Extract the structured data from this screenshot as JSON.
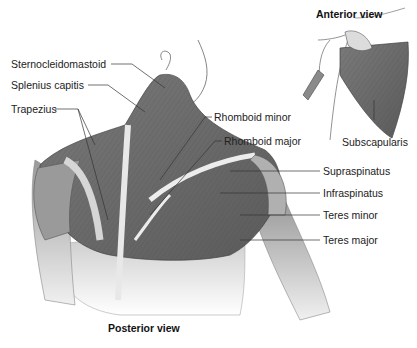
{
  "diagram": {
    "views": {
      "anterior": "Anterior view",
      "posterior": "Posterior view"
    },
    "labels": {
      "sternocleidomastoid": "Sternocleidomastoid",
      "splenius_capitis": "Splenius capitis",
      "trapezius": "Trapezius",
      "rhomboid_minor": "Rhomboid minor",
      "rhomboid_major": "Rhomboid major",
      "subscapularis": "Subscapularis",
      "supraspinatus": "Supraspinatus",
      "infraspinatus": "Infraspinatus",
      "teres_minor": "Teres minor",
      "teres_major": "Teres major"
    },
    "colors": {
      "muscle_dark": "#6e6e6e",
      "muscle_mid": "#8c8c8c",
      "muscle_light": "#b8b8b8",
      "skin": "#e6e6e6",
      "line": "#333333"
    }
  }
}
